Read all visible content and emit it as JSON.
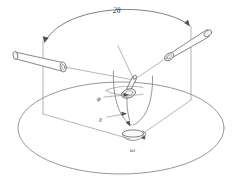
{
  "figure": {
    "background_color": "#ffffff",
    "line_color": "#6a6a70",
    "label_color": "#3f3f46"
  },
  "labels": {
    "two_theta": "2θ",
    "phi": "ϕ",
    "chi": "χ",
    "omega": "ω"
  },
  "parts": {
    "collimator_tube": "collimator-tube",
    "detector_tube": "detector-tube",
    "two_theta_arc": "two-theta-arc",
    "goniometer_head": "goniometer-head",
    "crystal_needle": "crystal-needle",
    "chi_circle": "chi-circle",
    "phi_circle": "phi-circle",
    "omega_base": "omega-base",
    "base_circle": "base-circle",
    "left_support_post": "left-support-post",
    "right_support_post": "right-support-post"
  },
  "annotations": {
    "two_theta_note": "Angle between the incident beam tube and the diffracted beam tube",
    "phi_note": "Rotation of the crystal about the goniometer head spindle axis",
    "chi_note": "Rotation of the goniometer head around the chi arc",
    "omega_note": "Rotation of the whole goniometer about the vertical axis"
  }
}
